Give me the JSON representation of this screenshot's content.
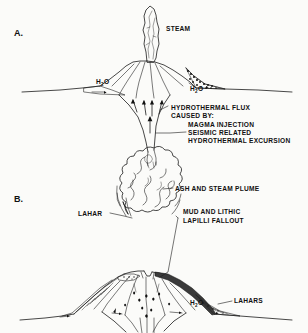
{
  "figure": {
    "background_color": "#fbfbf9",
    "ink_color": "#1a1a1a",
    "shade_color": "#3a3a3a",
    "width": 308,
    "height": 333,
    "kind": "line-drawing-diagram"
  },
  "panel_a": {
    "letter": "A.",
    "labels": {
      "steam": "STEAM",
      "water_left": "H",
      "water_left_sub": "2",
      "water_left_tail": "O",
      "water_right": "H",
      "water_right_sub": "2",
      "water_right_tail": "O",
      "flux_line1": "HYDROTHERMAL FLUX",
      "flux_line2": "CAUSED BY:",
      "cause1": "MAGMA INJECTION",
      "cause2": "SEISMIC RELATED",
      "cause3": "HYDROTHERMAL EXCURSION"
    }
  },
  "panel_b": {
    "letter": "B.",
    "labels": {
      "plume": "ASH AND STEAM PLUME",
      "lahar_left": "LAHAR",
      "fallout_line1": "MUD AND LITHIC",
      "fallout_line2": "LAPILLI FALLOUT",
      "lahars_right": "LAHARS",
      "water_right": "H",
      "water_right_sub": "2",
      "water_right_tail": "O"
    }
  }
}
